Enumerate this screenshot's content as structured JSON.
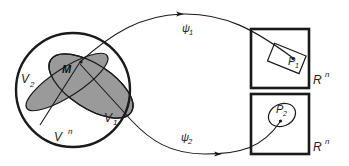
{
  "diagram": {
    "type": "manifold-coordinate-charts",
    "colors": {
      "stroke": "#1a1a1a",
      "fill_shaded": "#9a9a9a",
      "background": "#ffffff"
    },
    "domain": {
      "label": "V",
      "label_superscript": "n"
    },
    "neighborhoods": [
      {
        "label": "V",
        "subscript": "1"
      },
      {
        "label": "V",
        "subscript": "2"
      }
    ],
    "point": {
      "label": "M"
    },
    "maps": [
      {
        "label": "ψ",
        "subscript": "1"
      },
      {
        "label": "ψ",
        "subscript": "2"
      }
    ],
    "targets": [
      {
        "space_label": "R",
        "space_superscript": "n",
        "point_label": "P",
        "point_subscript": "1",
        "region_shape": "rectangle"
      },
      {
        "space_label": "R",
        "space_superscript": "n",
        "point_label": "P",
        "point_subscript": "2",
        "region_shape": "ellipse"
      }
    ]
  }
}
